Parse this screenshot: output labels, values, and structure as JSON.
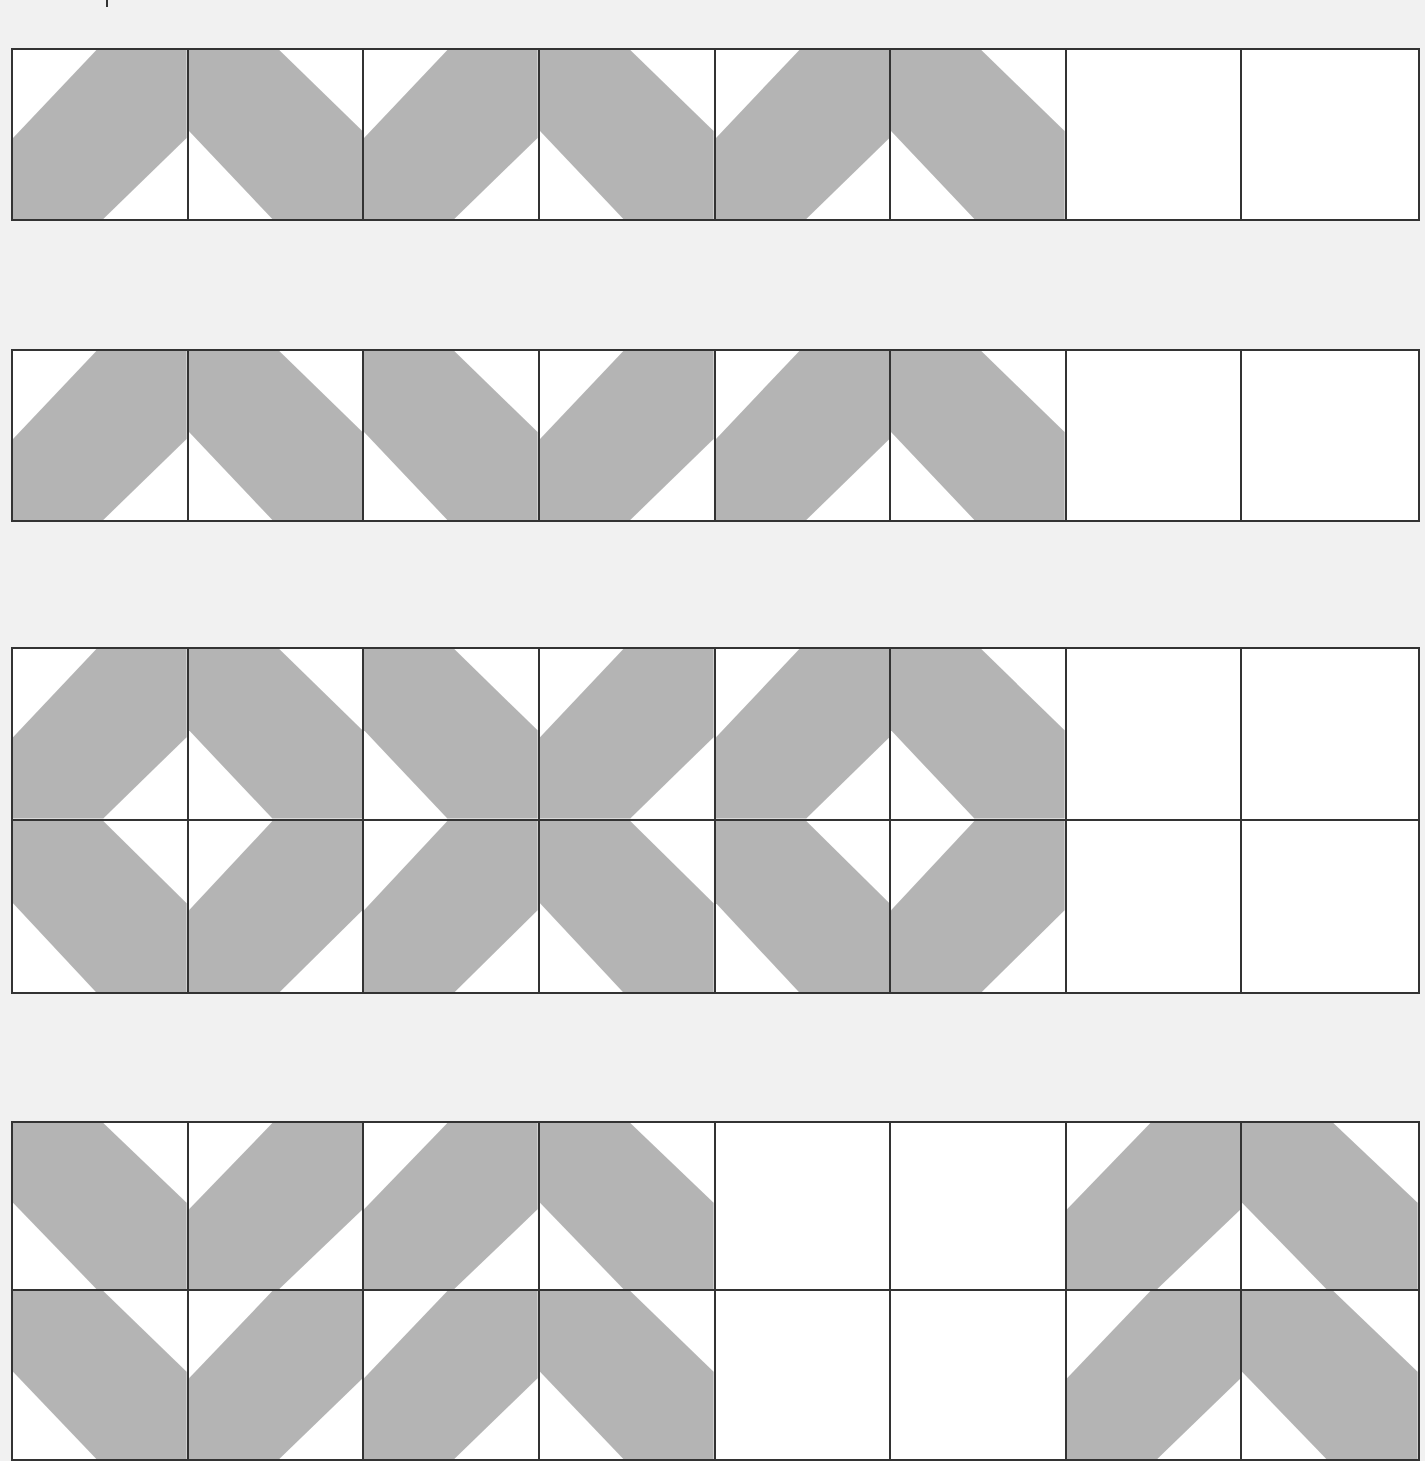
{
  "worksheet": {
    "colors": {
      "background": "#f1f1f1",
      "band": "#b4b4b4",
      "tile": "#ffffff",
      "border": "#333333"
    },
    "tile_legend": {
      "A": "band rising left-to-right (/)",
      "B": "band falling left-to-right (\\)",
      "_": "empty tile to fill in"
    },
    "patterns": [
      {
        "id": "pattern-1",
        "rows": [
          [
            "A",
            "B",
            "A",
            "B",
            "A",
            "B",
            "_",
            "_"
          ]
        ]
      },
      {
        "id": "pattern-2",
        "rows": [
          [
            "A",
            "B",
            "B",
            "A",
            "A",
            "B",
            "_",
            "_"
          ]
        ]
      },
      {
        "id": "pattern-3",
        "rows": [
          [
            "A",
            "B",
            "B",
            "A",
            "A",
            "B",
            "_",
            "_"
          ],
          [
            "B",
            "A",
            "A",
            "B",
            "B",
            "A",
            "_",
            "_"
          ]
        ]
      },
      {
        "id": "pattern-4",
        "rows": [
          [
            "B",
            "A",
            "A",
            "B",
            "_",
            "_",
            "A",
            "B"
          ],
          [
            "B",
            "A",
            "A",
            "B",
            "_",
            "_",
            "A",
            "B"
          ]
        ]
      }
    ]
  }
}
